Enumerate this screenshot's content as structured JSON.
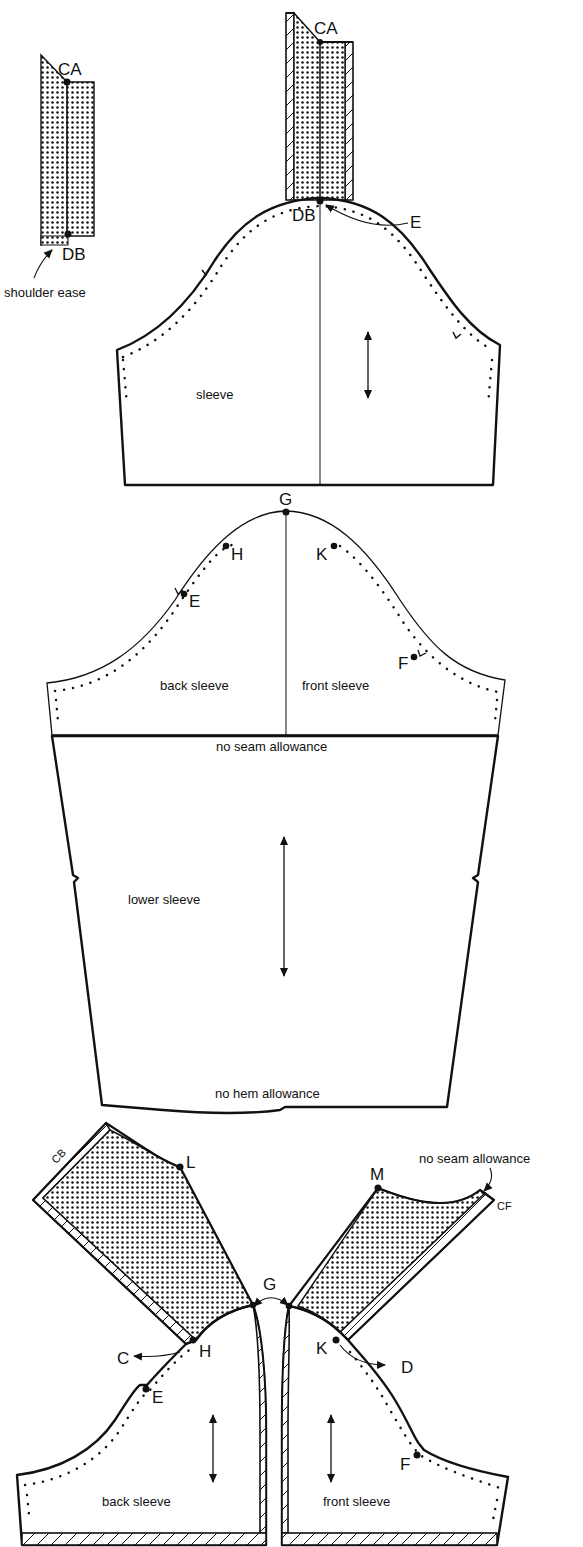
{
  "diagram": {
    "colors": {
      "ink": "#111111",
      "paper": "#ffffff"
    },
    "shoulder_piece": {
      "points": [
        "CA",
        "DB"
      ],
      "annotation": "shoulder ease"
    },
    "top_sleeve": {
      "label": "sleeve",
      "points": [
        "CA",
        "DB",
        "E"
      ],
      "grainline": "grainline-arrow"
    },
    "split_sleeve": {
      "points": [
        "G",
        "H",
        "K",
        "E",
        "F"
      ],
      "back_label": "back sleeve",
      "front_label": "front sleeve",
      "seam_note": "no seam allowance"
    },
    "lower_sleeve": {
      "label": "lower sleeve",
      "top_note": "no seam allowance",
      "bottom_note": "no hem allowance",
      "grainline": "grainline-arrow"
    },
    "yoke_pieces": {
      "back": {
        "edge_label": "CB",
        "points": [
          "L",
          "H",
          "C",
          "E",
          "G"
        ],
        "sleeve_label": "back sleeve"
      },
      "front": {
        "edge_label": "CF",
        "points": [
          "M",
          "K",
          "D",
          "F",
          "G"
        ],
        "sleeve_label": "front sleeve",
        "annotation": "no seam allowance"
      },
      "shared_point": "G"
    }
  }
}
